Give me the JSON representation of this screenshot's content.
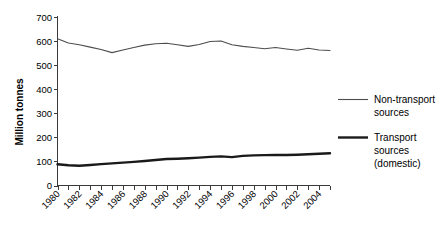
{
  "chart_data": {
    "type": "line",
    "title": "",
    "subtitle": "",
    "xlabel": "",
    "ylabel": "Million tonnes",
    "ylim": [
      0,
      700
    ],
    "ytick_step": 100,
    "yticks": [
      "0",
      "100",
      "200",
      "300",
      "400",
      "500",
      "600",
      "700"
    ],
    "grid": false,
    "legend_position": "right",
    "x": [
      1980,
      1981,
      1982,
      1983,
      1984,
      1985,
      1986,
      1987,
      1988,
      1989,
      1990,
      1991,
      1992,
      1993,
      1994,
      1995,
      1996,
      1997,
      1998,
      1999,
      2000,
      2001,
      2002,
      2003,
      2004,
      2005
    ],
    "xtick_labels": [
      "1980",
      "",
      "1982",
      "",
      "1984",
      "",
      "1986",
      "",
      "1988",
      "",
      "1990",
      "",
      "1992",
      "",
      "1994",
      "",
      "1996",
      "",
      "1998",
      "",
      "2000",
      "",
      "2002",
      "",
      "2004",
      ""
    ],
    "xtick_labels_visible": [
      "1980",
      "1982",
      "1984",
      "1986",
      "1988",
      "1990",
      "1992",
      "1994",
      "1996",
      "1998",
      "2000",
      "2002",
      "2004"
    ],
    "xtick_rotation_degrees": -45,
    "series": [
      {
        "name": "Non-transport sources",
        "style": "thin",
        "color": "#4d4d4d",
        "values": [
          610,
          592,
          585,
          575,
          565,
          552,
          563,
          573,
          583,
          589,
          591,
          585,
          578,
          586,
          598,
          600,
          585,
          578,
          573,
          568,
          573,
          567,
          562,
          570,
          563,
          561
        ]
      },
      {
        "name": "Transport sources (domestic)",
        "style": "thick",
        "color": "#1a1a1a",
        "values": [
          88,
          84,
          82,
          85,
          89,
          92,
          95,
          98,
          102,
          106,
          110,
          111,
          113,
          116,
          119,
          121,
          118,
          123,
          125,
          126,
          127,
          127,
          128,
          130,
          132,
          134
        ]
      }
    ]
  },
  "legend": {
    "entries": [
      {
        "label_line_1": "Non-transport",
        "label_line_2": "sources",
        "label_line_3": ""
      },
      {
        "label_line_1": "Transport",
        "label_line_2": "sources",
        "label_line_3": "(domestic)"
      }
    ]
  },
  "axis": {
    "y_title": "Million tonnes"
  }
}
